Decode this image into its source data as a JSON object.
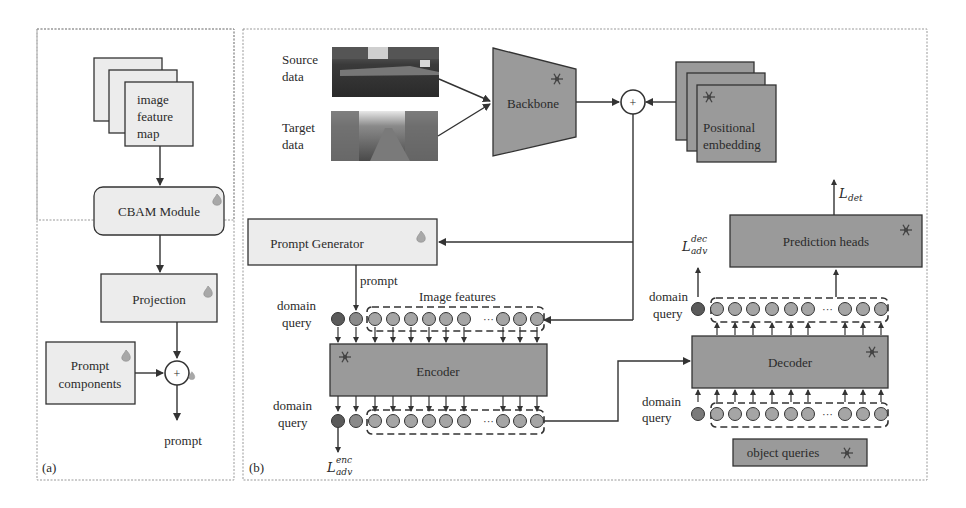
{
  "colors": {
    "light_box": "#ececec",
    "dark_box": "#9a9a9a",
    "stroke": "#333333",
    "dashed_border": "#999999",
    "circle_dark": "#5a5a5a",
    "circle_mid": "#8a8a8a",
    "circle_light": "#a5a5a5",
    "flame": "#a0a0a0"
  },
  "panel_a": {
    "label": "(a)",
    "feature_map": {
      "line1": "image",
      "line2": "feature",
      "line3": "map"
    },
    "cbam": "CBAM Module",
    "projection": "Projection",
    "prompt_components": {
      "line1": "Prompt",
      "line2": "components"
    },
    "plus": "+",
    "output": "prompt"
  },
  "panel_b": {
    "label": "(b)",
    "source": {
      "line1": "Source",
      "line2": "data"
    },
    "target": {
      "line1": "Target",
      "line2": "data"
    },
    "backbone": "Backbone",
    "plus": "+",
    "positional": {
      "line1": "Positional",
      "line2": "embedding"
    },
    "prompt_generator": "Prompt Generator",
    "prompt_label": "prompt",
    "image_features": "Image features",
    "domain_query": {
      "line1": "domain",
      "line2": "query"
    },
    "encoder": "Encoder",
    "decoder": "Decoder",
    "prediction_heads": "Prediction heads",
    "object_queries": "object queries",
    "ellipsis": "···",
    "loss_enc": {
      "base": "L",
      "sup": "enc",
      "sub": "adv"
    },
    "loss_dec": {
      "base": "L",
      "sup": "dec",
      "sub": "adv"
    },
    "loss_det": {
      "base": "L",
      "sub": "det"
    }
  },
  "icons": {
    "frozen": "snowflake-icon",
    "trainable": "flame-icon"
  }
}
